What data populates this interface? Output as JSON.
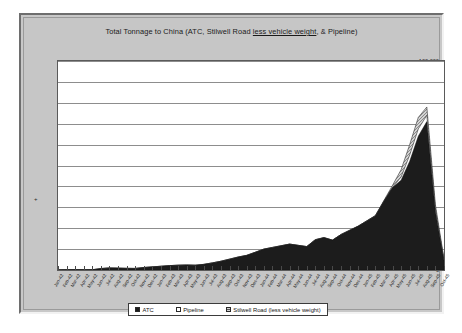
{
  "window": {
    "name": "chart-window"
  },
  "chart_data": {
    "type": "area",
    "stacked": true,
    "title": "Total Tonnage to China (ATC, Stilwell Road less vehicle weight, & Pipeline)",
    "title_parts": {
      "before": "Total Tonnage to China (ATC, Stilwell Road ",
      "underlined": "less vehicle weight",
      "after": ", & Pipeline)"
    },
    "xlabel": "",
    "ylabel": "",
    "ylim": [
      0,
      100000
    ],
    "ytick_step": 10000,
    "ytick_labels": [
      "100,000",
      "90,000",
      "80,000",
      "70,000",
      "60,000",
      "50,000",
      "40,000",
      "30,000",
      "20,000",
      "10,000",
      "0"
    ],
    "ytick_values": [
      100000,
      90000,
      80000,
      70000,
      60000,
      50000,
      40000,
      30000,
      20000,
      10000,
      0
    ],
    "grid": true,
    "legend_position": "bottom",
    "legend": [
      "ATC",
      "Pipeline",
      "Stilwell Road (less vehicle weight)"
    ],
    "axis_marker": "+",
    "categories": [
      "Jan-42",
      "Feb-42",
      "Mar-42",
      "Apr-42",
      "May-42",
      "Jun-42",
      "Jul-42",
      "Aug-42",
      "Sep-42",
      "Oct-42",
      "Nov-42",
      "Dec-42",
      "Jan-43",
      "Feb-43",
      "Mar-43",
      "Apr-43",
      "May-43",
      "Jun-43",
      "Jul-43",
      "Aug-43",
      "Sep-43",
      "Oct-43",
      "Nov-43",
      "Dec-43",
      "Jan-44",
      "Feb-44",
      "Mar-44",
      "Apr-44",
      "May-44",
      "Jun-44",
      "Jul-44",
      "Aug-44",
      "Sep-44",
      "Oct-44",
      "Nov-44",
      "Dec-44",
      "Jan-45",
      "Feb-45",
      "Mar-45",
      "Apr-45",
      "May-45",
      "Jun-45",
      "Jul-45",
      "Aug-45",
      "Sep-45",
      "Oct-45"
    ],
    "series": [
      {
        "name": "ATC",
        "color": "#1c1c1c",
        "values": [
          0,
          80,
          150,
          80,
          120,
          700,
          1000,
          900,
          800,
          750,
          1200,
          1500,
          1800,
          2100,
          2300,
          2400,
          2300,
          2700,
          3400,
          4200,
          5200,
          6200,
          7000,
          8500,
          10000,
          10800,
          11600,
          12400,
          11800,
          11200,
          14500,
          15500,
          14300,
          17000,
          19000,
          21000,
          23500,
          26000,
          33000,
          39500,
          43000,
          52000,
          64000,
          71000,
          28000,
          4500
        ]
      },
      {
        "name": "Pipeline",
        "color": "#ffffff",
        "values": [
          0,
          0,
          0,
          0,
          0,
          0,
          0,
          0,
          0,
          0,
          0,
          0,
          0,
          0,
          0,
          0,
          0,
          0,
          0,
          0,
          0,
          0,
          0,
          0,
          0,
          0,
          0,
          0,
          0,
          0,
          0,
          0,
          0,
          0,
          0,
          0,
          0,
          0,
          0,
          0,
          1500,
          3000,
          3500,
          3000,
          1200,
          300
        ]
      },
      {
        "name": "Stilwell Road (less vehicle weight)",
        "color": "#d2d2d2",
        "values": [
          0,
          0,
          0,
          0,
          0,
          0,
          0,
          0,
          0,
          0,
          0,
          0,
          0,
          0,
          0,
          0,
          0,
          0,
          0,
          0,
          0,
          0,
          0,
          0,
          0,
          0,
          0,
          0,
          0,
          0,
          0,
          0,
          0,
          0,
          0,
          0,
          0,
          0,
          300,
          1000,
          3500,
          5000,
          5500,
          4000,
          2000,
          500
        ]
      }
    ]
  }
}
